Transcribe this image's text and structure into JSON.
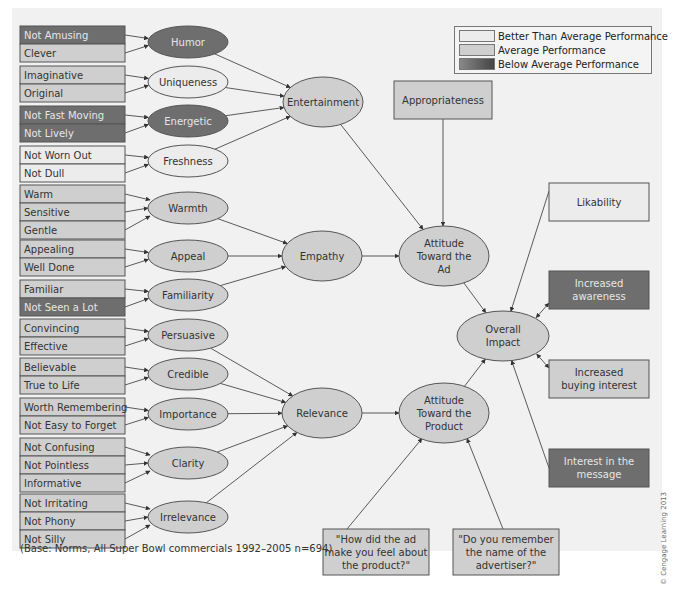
{
  "colors": {
    "better": "#ececec",
    "average": "#cfcfcf",
    "below": "#6e6e6e",
    "stroke": "#555555",
    "text_dark": "#333333",
    "text_light": "#e6e6e6",
    "panel": "#f1f1f1"
  },
  "legend": {
    "items": [
      {
        "label": "Better Than Average Performance",
        "level": "better"
      },
      {
        "label": "Average Performance",
        "level": "average"
      },
      {
        "label": "Below Average Performance",
        "level": "below"
      }
    ]
  },
  "attribute_groups": [
    {
      "y": 26,
      "rows": [
        {
          "label": "Not Amusing",
          "level": "below"
        },
        {
          "label": "Clever",
          "level": "average"
        }
      ],
      "target": "humor"
    },
    {
      "y": 66,
      "rows": [
        {
          "label": "Imaginative",
          "level": "average"
        },
        {
          "label": "Original",
          "level": "average"
        }
      ],
      "target": "uniqueness"
    },
    {
      "y": 106,
      "rows": [
        {
          "label": "Not Fast Moving",
          "level": "below"
        },
        {
          "label": "Not Lively",
          "level": "below"
        }
      ],
      "target": "energetic"
    },
    {
      "y": 146,
      "rows": [
        {
          "label": "Not Worn Out",
          "level": "better"
        },
        {
          "label": "Not Dull",
          "level": "better"
        }
      ],
      "target": "freshness"
    },
    {
      "y": 185,
      "rows": [
        {
          "label": "Warm",
          "level": "average"
        },
        {
          "label": "Sensitive",
          "level": "average"
        },
        {
          "label": "Gentle",
          "level": "average"
        }
      ],
      "target": "warmth"
    },
    {
      "y": 240,
      "rows": [
        {
          "label": "Appealing",
          "level": "average"
        },
        {
          "label": "Well Done",
          "level": "average"
        }
      ],
      "target": "appeal"
    },
    {
      "y": 280,
      "rows": [
        {
          "label": "Familiar",
          "level": "average"
        },
        {
          "label": "Not Seen a Lot",
          "level": "below"
        }
      ],
      "target": "familiarity"
    },
    {
      "y": 319,
      "rows": [
        {
          "label": "Convincing",
          "level": "average"
        },
        {
          "label": "Effective",
          "level": "average"
        }
      ],
      "target": "persuasive"
    },
    {
      "y": 358,
      "rows": [
        {
          "label": "Believable",
          "level": "average"
        },
        {
          "label": "True to Life",
          "level": "average"
        }
      ],
      "target": "credible"
    },
    {
      "y": 398,
      "rows": [
        {
          "label": "Worth Remembering",
          "level": "average"
        },
        {
          "label": "Not Easy to Forget",
          "level": "average"
        }
      ],
      "target": "importance"
    },
    {
      "y": 438,
      "rows": [
        {
          "label": "Not Confusing",
          "level": "average"
        },
        {
          "label": "Not Pointless",
          "level": "average"
        },
        {
          "label": "Informative",
          "level": "average"
        }
      ],
      "target": "clarity"
    },
    {
      "y": 494,
      "rows": [
        {
          "label": "Not Irritating",
          "level": "average"
        },
        {
          "label": "Not Phony",
          "level": "average"
        },
        {
          "label": "Not Silly",
          "level": "average"
        }
      ],
      "target": "irrelevance"
    }
  ],
  "nodes": {
    "humor": {
      "label": [
        "Humor"
      ],
      "cx": 188,
      "cy": 42,
      "rx": 40,
      "ry": 16,
      "level": "below"
    },
    "uniqueness": {
      "label": [
        "Uniqueness"
      ],
      "cx": 188,
      "cy": 82,
      "rx": 40,
      "ry": 16,
      "level": "better"
    },
    "energetic": {
      "label": [
        "Energetic"
      ],
      "cx": 188,
      "cy": 121,
      "rx": 40,
      "ry": 16,
      "level": "below"
    },
    "freshness": {
      "label": [
        "Freshness"
      ],
      "cx": 188,
      "cy": 161,
      "rx": 40,
      "ry": 16,
      "level": "better"
    },
    "warmth": {
      "label": [
        "Warmth"
      ],
      "cx": 188,
      "cy": 208,
      "rx": 40,
      "ry": 16,
      "level": "average"
    },
    "appeal": {
      "label": [
        "Appeal"
      ],
      "cx": 188,
      "cy": 256,
      "rx": 40,
      "ry": 16,
      "level": "average"
    },
    "familiarity": {
      "label": [
        "Familiarity"
      ],
      "cx": 188,
      "cy": 295,
      "rx": 40,
      "ry": 16,
      "level": "average"
    },
    "persuasive": {
      "label": [
        "Persuasive"
      ],
      "cx": 188,
      "cy": 335,
      "rx": 40,
      "ry": 16,
      "level": "average"
    },
    "credible": {
      "label": [
        "Credible"
      ],
      "cx": 188,
      "cy": 374,
      "rx": 40,
      "ry": 16,
      "level": "average"
    },
    "importance": {
      "label": [
        "Importance"
      ],
      "cx": 188,
      "cy": 414,
      "rx": 40,
      "ry": 16,
      "level": "average"
    },
    "clarity": {
      "label": [
        "Clarity"
      ],
      "cx": 188,
      "cy": 463,
      "rx": 40,
      "ry": 16,
      "level": "average"
    },
    "irrelevance": {
      "label": [
        "Irrelevance"
      ],
      "cx": 188,
      "cy": 517,
      "rx": 40,
      "ry": 16,
      "level": "average"
    },
    "entertainment": {
      "label": [
        "Entertainment"
      ],
      "cx": 323,
      "cy": 102,
      "rx": 40,
      "ry": 25,
      "level": "average"
    },
    "empathy": {
      "label": [
        "Empathy"
      ],
      "cx": 322,
      "cy": 256,
      "rx": 40,
      "ry": 25,
      "level": "average"
    },
    "relevance": {
      "label": [
        "Relevance"
      ],
      "cx": 322,
      "cy": 413,
      "rx": 40,
      "ry": 25,
      "level": "average"
    },
    "attitude_ad": {
      "label": [
        "Attitude",
        "Toward the",
        "Ad"
      ],
      "cx": 444,
      "cy": 256,
      "rx": 45,
      "ry": 30,
      "level": "average"
    },
    "attitude_product": {
      "label": [
        "Attitude",
        "Toward the",
        "Product"
      ],
      "cx": 444,
      "cy": 413,
      "rx": 45,
      "ry": 30,
      "level": "average"
    },
    "overall_impact": {
      "label": [
        "Overall",
        "Impact"
      ],
      "cx": 503,
      "cy": 336,
      "rx": 46,
      "ry": 25,
      "level": "average"
    }
  },
  "boxes": {
    "appropriateness": {
      "label": [
        "Appropriateness"
      ],
      "x": 394,
      "y": 81,
      "w": 98,
      "h": 38,
      "level": "average"
    },
    "likability": {
      "label": [
        "Likability"
      ],
      "x": 549,
      "y": 183,
      "w": 100,
      "h": 38,
      "level": "better"
    },
    "increased_awareness": {
      "label": [
        "Increased",
        "awareness"
      ],
      "x": 549,
      "y": 271,
      "w": 100,
      "h": 38,
      "level": "below"
    },
    "increased_buying_interest": {
      "label": [
        "Increased",
        "buying interest"
      ],
      "x": 549,
      "y": 360,
      "w": 100,
      "h": 38,
      "level": "average"
    },
    "interest_message": {
      "label": [
        "Interest in the",
        "message"
      ],
      "x": 549,
      "y": 449,
      "w": 100,
      "h": 38,
      "level": "below"
    },
    "question_feel": {
      "label": [
        "\"How did the ad",
        "make you feel about",
        "the product?\""
      ],
      "x": 323,
      "y": 529,
      "w": 106,
      "h": 46,
      "level": "average"
    },
    "question_name": {
      "label": [
        "\"Do you remember",
        "the name of the",
        "advertiser?\""
      ],
      "x": 453,
      "y": 529,
      "w": 106,
      "h": 46,
      "level": "average"
    }
  },
  "edges": [
    [
      "humor",
      "entertainment"
    ],
    [
      "uniqueness",
      "entertainment"
    ],
    [
      "energetic",
      "entertainment"
    ],
    [
      "freshness",
      "entertainment"
    ],
    [
      "warmth",
      "empathy"
    ],
    [
      "appeal",
      "empathy"
    ],
    [
      "familiarity",
      "empathy"
    ],
    [
      "persuasive",
      "relevance"
    ],
    [
      "credible",
      "relevance"
    ],
    [
      "importance",
      "relevance"
    ],
    [
      "clarity",
      "relevance"
    ],
    [
      "irrelevance",
      "relevance"
    ],
    [
      "entertainment",
      "attitude_ad"
    ],
    [
      "appropriateness",
      "attitude_ad"
    ],
    [
      "empathy",
      "attitude_ad"
    ],
    [
      "relevance",
      "attitude_product"
    ],
    [
      "question_feel",
      "attitude_product"
    ],
    [
      "question_name",
      "attitude_product"
    ],
    [
      "attitude_ad",
      "overall_impact"
    ],
    [
      "attitude_product",
      "overall_impact"
    ],
    [
      "likability",
      "overall_impact"
    ],
    [
      "interest_message",
      "overall_impact"
    ]
  ],
  "bidirectional_edges": [
    [
      "increased_awareness",
      "overall_impact"
    ],
    [
      "increased_buying_interest",
      "overall_impact"
    ]
  ],
  "footnote": "(Base: Norms, All Super Bowl commercials 1992–2005 n=694)",
  "copyright": "© Cengage Learning 2013"
}
